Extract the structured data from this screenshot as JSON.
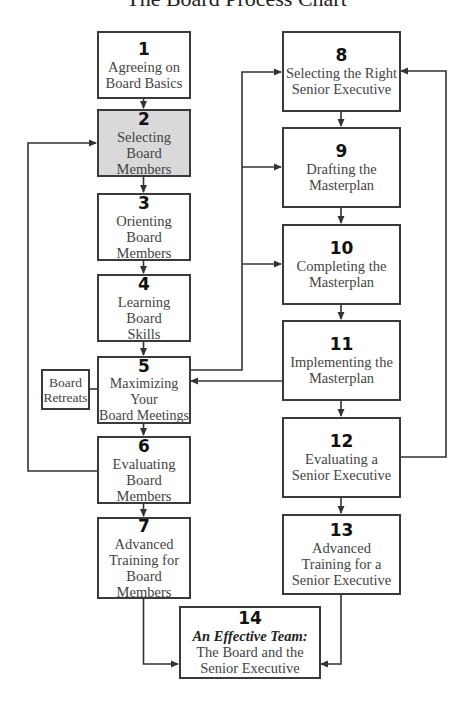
{
  "title": "The Board Process Chart",
  "colors": {
    "line": "#333333",
    "box_border": "#3a3a3a",
    "highlight_fill": "#d9d9d9",
    "text": "#444444"
  },
  "steps": [
    {
      "num": "1",
      "label": "Agreeing on\nBoard Basics"
    },
    {
      "num": "2",
      "label": "Selecting Board\nMembers",
      "highlighted": true
    },
    {
      "num": "3",
      "label": "Orienting Board\nMembers"
    },
    {
      "num": "4",
      "label": "Learning Board\nSkills"
    },
    {
      "num": "5",
      "label": "Maximizing Your\nBoard Meetings"
    },
    {
      "num": "6",
      "label": "Evaluating\nBoard Members"
    },
    {
      "num": "7",
      "label": "Advanced\nTraining for\nBoard Members"
    },
    {
      "num": "8",
      "label": "Selecting the Right\nSenior Executive"
    },
    {
      "num": "9",
      "label": "Drafting the\nMasterplan"
    },
    {
      "num": "10",
      "label": "Completing the\nMasterplan"
    },
    {
      "num": "11",
      "label": "Implementing the\nMasterplan"
    },
    {
      "num": "12",
      "label": "Evaluating a\nSenior Executive"
    },
    {
      "num": "13",
      "label": "Advanced\nTraining for a\nSenior Executive"
    },
    {
      "num": "14",
      "emphasis": "An Effective Team:",
      "label": "The Board and the\nSenior Executive"
    }
  ],
  "side_note": {
    "label": "Board\nRetreats"
  }
}
